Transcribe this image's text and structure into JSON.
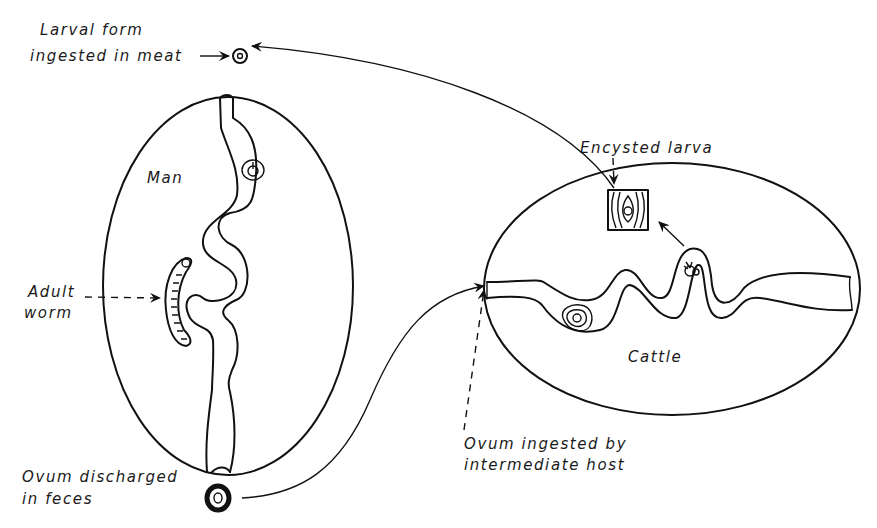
{
  "diagram": {
    "type": "life-cycle",
    "hosts": {
      "definitive": {
        "label": "Man"
      },
      "intermediate": {
        "label": "Cattle"
      }
    },
    "labels": {
      "larval_form_line1": "Larval form",
      "larval_form_line2": "ingested in meat",
      "encysted_larva": "Encysted larva",
      "adult_worm_line1": "Adult",
      "adult_worm_line2": "worm",
      "ovum_discharged_line1": "Ovum discharged",
      "ovum_discharged_line2": "in feces",
      "ovum_ingested_line1": "Ovum ingested by",
      "ovum_ingested_line2": "intermediate host"
    },
    "stages": [
      {
        "id": "ovum-in-feces",
        "from": "Man",
        "to": "Cattle"
      },
      {
        "id": "encysted-larva",
        "host": "Cattle"
      },
      {
        "id": "larval-form-in-meat",
        "from": "Cattle",
        "to": "Man"
      },
      {
        "id": "adult-worm",
        "host": "Man"
      }
    ],
    "colors": {
      "ink": "#111111",
      "background": "#ffffff"
    }
  }
}
